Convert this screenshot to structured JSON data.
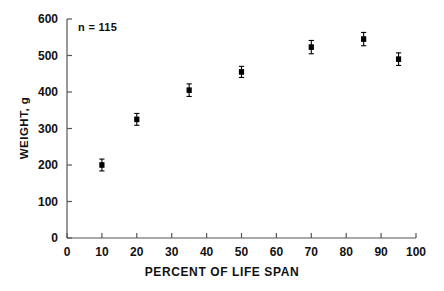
{
  "chart_data": {
    "type": "scatter",
    "title": "",
    "xlabel": "PERCENT OF LIFE SPAN",
    "ylabel": "WEIGHT, g",
    "annotation": "n = 115",
    "xlim": [
      0,
      100
    ],
    "ylim": [
      0,
      600
    ],
    "xticks": [
      0,
      10,
      20,
      30,
      40,
      50,
      60,
      70,
      80,
      90,
      100
    ],
    "yticks": [
      0,
      100,
      200,
      300,
      400,
      500,
      600
    ],
    "xtick_labels": [
      "0",
      "10",
      "20",
      "30",
      "40",
      "50",
      "60",
      "70",
      "80",
      "90",
      "100"
    ],
    "ytick_labels": [
      "0",
      "100",
      "200",
      "300",
      "400",
      "500",
      "600"
    ],
    "grid": false,
    "legend": "none",
    "marker": "filled-square",
    "error_bars": "vertical",
    "series": [
      {
        "name": "Weight by percent of life span",
        "color": "#000000",
        "points": [
          {
            "x": 10,
            "y": 200,
            "yerr": 8
          },
          {
            "x": 20,
            "y": 325,
            "yerr": 8
          },
          {
            "x": 35,
            "y": 405,
            "yerr": 9
          },
          {
            "x": 50,
            "y": 455,
            "yerr": 7
          },
          {
            "x": 70,
            "y": 523,
            "yerr": 10
          },
          {
            "x": 85,
            "y": 545,
            "yerr": 10
          },
          {
            "x": 95,
            "y": 490,
            "yerr": 9
          }
        ]
      }
    ]
  }
}
